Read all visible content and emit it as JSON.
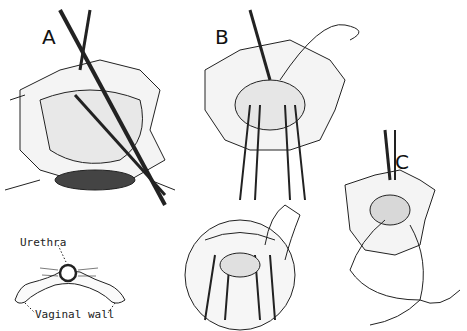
{
  "figure": {
    "panels": [
      {
        "id": "A",
        "label": "A"
      },
      {
        "id": "B",
        "label": "B"
      },
      {
        "id": "C",
        "label": "C"
      }
    ],
    "inset": {
      "annotations": {
        "urethra": "Urethra",
        "vaginal_wall": "Vaginal wall"
      }
    }
  }
}
